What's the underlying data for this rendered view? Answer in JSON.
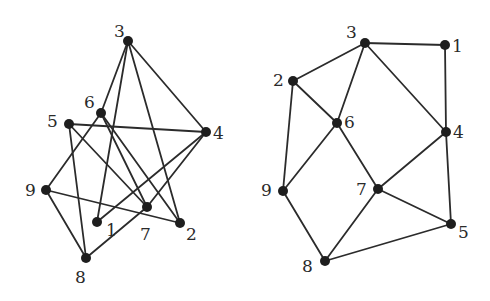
{
  "diagram": {
    "type": "graph-drawings",
    "graphs": [
      {
        "id": "left",
        "nodes": [
          {
            "id": "1",
            "x": 97,
            "y": 222,
            "lx": 106,
            "ly": 236
          },
          {
            "id": "2",
            "x": 180,
            "y": 223,
            "lx": 186,
            "ly": 240
          },
          {
            "id": "3",
            "x": 128,
            "y": 41,
            "lx": 114,
            "ly": 37
          },
          {
            "id": "4",
            "x": 206,
            "y": 132,
            "lx": 213,
            "ly": 139
          },
          {
            "id": "5",
            "x": 69,
            "y": 124,
            "lx": 47,
            "ly": 127
          },
          {
            "id": "6",
            "x": 101,
            "y": 113,
            "lx": 84,
            "ly": 108
          },
          {
            "id": "7",
            "x": 147,
            "y": 207,
            "lx": 140,
            "ly": 240
          },
          {
            "id": "8",
            "x": 86,
            "y": 258,
            "lx": 75,
            "ly": 283
          },
          {
            "id": "9",
            "x": 46,
            "y": 190,
            "lx": 25,
            "ly": 196
          }
        ],
        "edges": [
          [
            "3",
            "6"
          ],
          [
            "3",
            "1"
          ],
          [
            "3",
            "2"
          ],
          [
            "3",
            "4"
          ],
          [
            "5",
            "4"
          ],
          [
            "5",
            "8"
          ],
          [
            "5",
            "7"
          ],
          [
            "6",
            "9"
          ],
          [
            "6",
            "7"
          ],
          [
            "6",
            "2"
          ],
          [
            "4",
            "1"
          ],
          [
            "4",
            "7"
          ],
          [
            "9",
            "8"
          ],
          [
            "9",
            "2"
          ],
          [
            "8",
            "7"
          ]
        ]
      },
      {
        "id": "right",
        "nodes": [
          {
            "id": "1",
            "x": 445,
            "y": 45,
            "lx": 452,
            "ly": 52
          },
          {
            "id": "2",
            "x": 293,
            "y": 81,
            "lx": 273,
            "ly": 86
          },
          {
            "id": "3",
            "x": 365,
            "y": 43,
            "lx": 346,
            "ly": 38
          },
          {
            "id": "4",
            "x": 446,
            "y": 132,
            "lx": 453,
            "ly": 138
          },
          {
            "id": "5",
            "x": 451,
            "y": 224,
            "lx": 458,
            "ly": 238
          },
          {
            "id": "6",
            "x": 337,
            "y": 123,
            "lx": 344,
            "ly": 128
          },
          {
            "id": "7",
            "x": 378,
            "y": 189,
            "lx": 356,
            "ly": 195
          },
          {
            "id": "8",
            "x": 325,
            "y": 261,
            "lx": 302,
            "ly": 272
          },
          {
            "id": "9",
            "x": 283,
            "y": 191,
            "lx": 261,
            "ly": 196
          }
        ],
        "edges": [
          [
            "3",
            "1"
          ],
          [
            "3",
            "2"
          ],
          [
            "3",
            "6"
          ],
          [
            "3",
            "4"
          ],
          [
            "1",
            "4"
          ],
          [
            "2",
            "6"
          ],
          [
            "2",
            "9"
          ],
          [
            "6",
            "9"
          ],
          [
            "6",
            "7"
          ],
          [
            "4",
            "7"
          ],
          [
            "4",
            "5"
          ],
          [
            "7",
            "5"
          ],
          [
            "7",
            "8"
          ],
          [
            "9",
            "8"
          ],
          [
            "8",
            "5"
          ]
        ]
      }
    ],
    "style": {
      "edge_color": "#2b2b2b",
      "node_color": "#1e1e1e",
      "node_radius": 5,
      "background": "#ffffff"
    }
  }
}
